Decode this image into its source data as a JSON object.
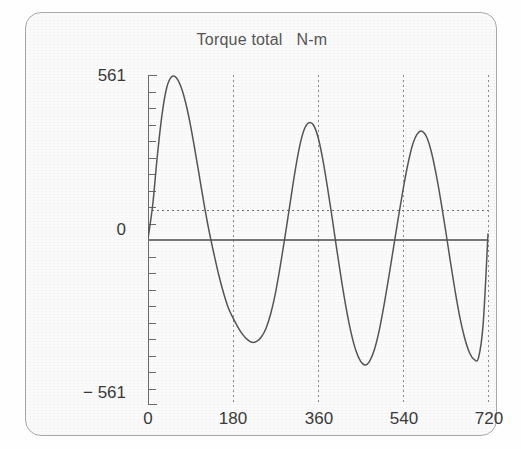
{
  "chart_data": {
    "type": "line",
    "title": "Torque total   N-m",
    "xlabel": "",
    "ylabel": "",
    "xlim": [
      0,
      720
    ],
    "ylim": [
      -561,
      561
    ],
    "xticks": [
      0,
      180,
      360,
      540,
      720
    ],
    "xticklabels": [
      "0",
      "180",
      "360",
      "540",
      "720"
    ],
    "yticks": [
      -561,
      561
    ],
    "yticklabels": [
      "− 561",
      "561"
    ],
    "y_minor_tick_count": 20,
    "grid": "vertical-dotted",
    "legend": "none",
    "zero_line": 0,
    "mean_line_value": 100,
    "series": [
      {
        "name": "Torque total",
        "color": "#555555",
        "x": [
          0,
          10,
          20,
          30,
          40,
          50,
          60,
          70,
          80,
          90,
          100,
          110,
          120,
          130,
          140,
          150,
          160,
          170,
          180,
          190,
          200,
          210,
          220,
          230,
          240,
          250,
          260,
          270,
          280,
          290,
          300,
          310,
          320,
          330,
          340,
          350,
          360,
          370,
          380,
          390,
          400,
          410,
          420,
          430,
          440,
          450,
          460,
          470,
          480,
          490,
          500,
          510,
          520,
          530,
          540,
          550,
          560,
          570,
          580,
          590,
          600,
          610,
          620,
          630,
          640,
          650,
          660,
          670,
          680,
          690,
          700,
          710,
          720
        ],
        "y": [
          5,
          120,
          290,
          430,
          520,
          555,
          552,
          520,
          465,
          390,
          300,
          205,
          110,
          25,
          -50,
          -120,
          -180,
          -230,
          -265,
          -295,
          -320,
          -338,
          -348,
          -345,
          -330,
          -300,
          -250,
          -180,
          -90,
          10,
          115,
          220,
          310,
          372,
          398,
          392,
          350,
          275,
          180,
          75,
          -35,
          -140,
          -235,
          -315,
          -375,
          -412,
          -425,
          -410,
          -370,
          -305,
          -220,
          -125,
          -25,
          75,
          170,
          255,
          322,
          360,
          370,
          350,
          300,
          225,
          135,
          35,
          -70,
          -170,
          -260,
          -330,
          -380,
          -405,
          -400,
          -280,
          20
        ]
      }
    ],
    "annotations": [
      {
        "kind": "horizontal-solid-line",
        "value": 0
      },
      {
        "kind": "horizontal-dotted-line",
        "value": 100,
        "label": "mean torque"
      }
    ]
  },
  "axis": {
    "y_top_label": "561",
    "y_bottom_label": "− 561",
    "y_zero_label": "0",
    "x_labels": [
      "0",
      "180",
      "360",
      "540",
      "720"
    ]
  },
  "colors": {
    "curve": "#555555",
    "axis": "#6a6a6a",
    "grid": "#8a8a8a",
    "zero_line": "#777777",
    "text": "#3a3a3a",
    "title_text": "#555555",
    "frame": "#a8a8a8",
    "background": "#fbfbfb"
  }
}
